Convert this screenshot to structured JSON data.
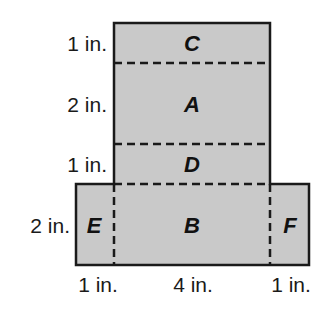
{
  "diagram": {
    "type": "net-of-rectangular-prism",
    "fill_color": "#c9c9c9",
    "stroke_color": "#1a1a1a",
    "regions": [
      {
        "id": "C",
        "label": "C",
        "x": 114,
        "y": 23,
        "w": 156,
        "h": 40
      },
      {
        "id": "A",
        "label": "A",
        "x": 114,
        "y": 63,
        "w": 156,
        "h": 81
      },
      {
        "id": "D",
        "label": "D",
        "x": 114,
        "y": 144,
        "w": 156,
        "h": 40
      },
      {
        "id": "B",
        "label": "B",
        "x": 114,
        "y": 184,
        "w": 156,
        "h": 81
      },
      {
        "id": "E",
        "label": "E",
        "x": 76,
        "y": 184,
        "w": 38,
        "h": 81
      },
      {
        "id": "F",
        "label": "F",
        "x": 270,
        "y": 184,
        "w": 39,
        "h": 81
      }
    ],
    "row_dimensions": [
      {
        "label": "1 in.",
        "region": "C"
      },
      {
        "label": "2 in.",
        "region": "A"
      },
      {
        "label": "1 in.",
        "region": "D"
      },
      {
        "label": "2 in.",
        "region": "B"
      }
    ],
    "column_dimensions": [
      {
        "label": "1 in.",
        "region": "E"
      },
      {
        "label": "4 in.",
        "region": "B"
      },
      {
        "label": "1 in.",
        "region": "F"
      }
    ]
  }
}
